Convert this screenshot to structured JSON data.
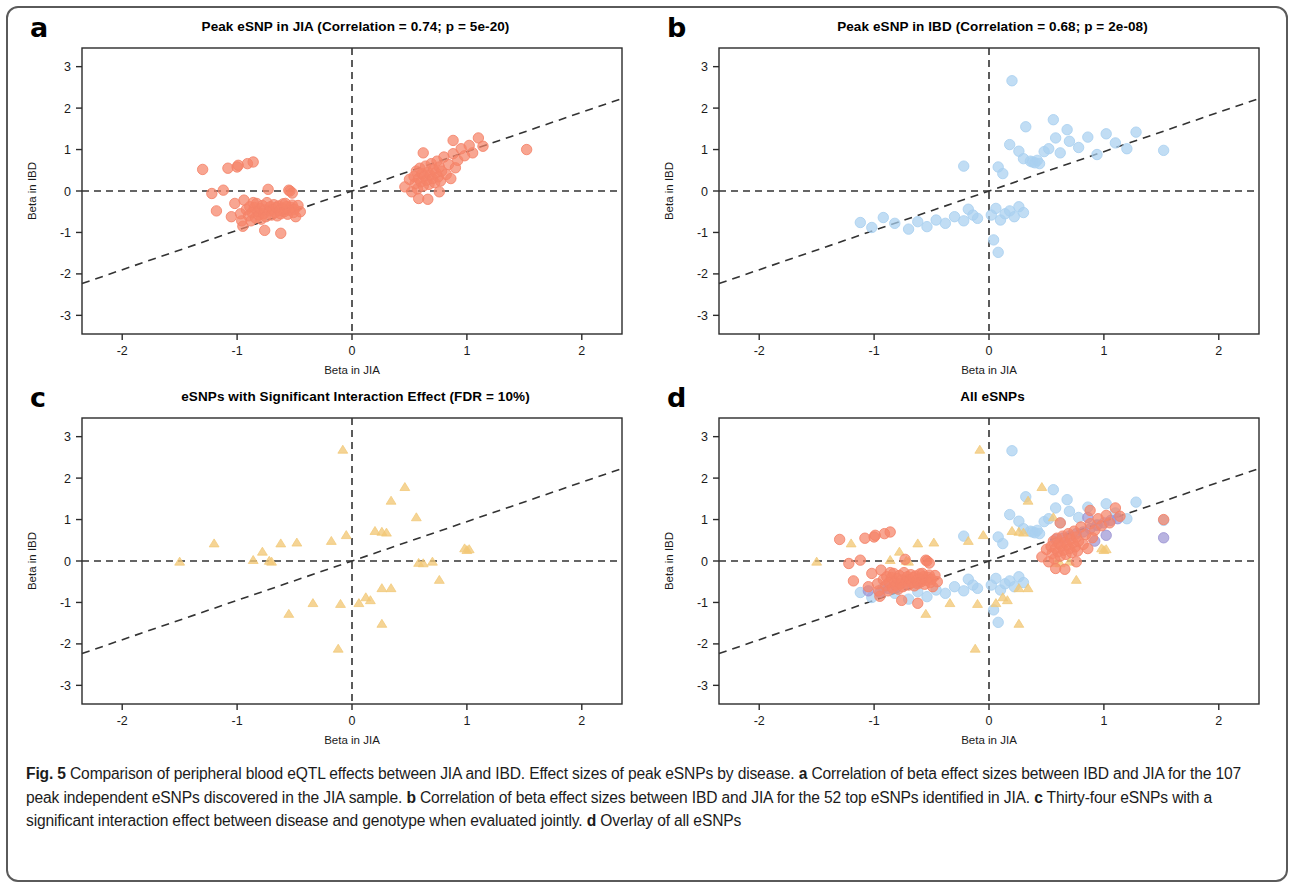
{
  "figure": {
    "label": "Fig. 5",
    "caption_text": " Comparison of peripheral blood eQTL effects between JIA and IBD. Effect sizes of peak eSNPs by disease. ",
    "caption_a_label": "a",
    "caption_a_text": " Correlation of beta effect sizes between IBD and JIA for the 107 peak independent eSNPs discovered in the JIA sample. ",
    "caption_b_label": "b",
    "caption_b_text": " Correlation of beta effect sizes between IBD and JIA for the 52 top eSNPs identified in JIA. ",
    "caption_c_label": "c",
    "caption_c_text": " Thirty-four eSNPs with a significant interaction effect between disease and genotype when evaluated jointly. ",
    "caption_d_label": "d",
    "caption_d_text": " Overlay of all eSNPs"
  },
  "colors": {
    "salmon": "#F58368",
    "blue": "#A9D0F0",
    "tan": "#F2C877",
    "purple": "#9D95D4",
    "axis": "#2b2b2b",
    "dash": "#333333"
  },
  "panels": [
    {
      "letter": "a",
      "title": "Peak eSNP in JIA (Correlation = 0.74; p = 5e-20)",
      "xlabel": "Beta in JIA",
      "ylabel": "Beta in IBD",
      "series_key": "a"
    },
    {
      "letter": "b",
      "title": "Peak eSNP in IBD (Correlation = 0.68; p = 2e-08)",
      "xlabel": "Beta in JIA",
      "ylabel": "Beta in IBD",
      "series_key": "b"
    },
    {
      "letter": "c",
      "title": "eSNPs with Significant Interaction Effect (FDR = 10%)",
      "xlabel": "Beta in JIA",
      "ylabel": "Beta in IBD",
      "series_key": "c"
    },
    {
      "letter": "d",
      "title": "All eSNPs",
      "xlabel": "Beta in JIA",
      "ylabel": "Beta in IBD",
      "series_key": "d"
    }
  ],
  "chart_data": [
    {
      "type": "scatter",
      "panel": "a",
      "title": "Peak eSNP in JIA (Correlation = 0.74; p = 5e-20)",
      "xlabel": "Beta in JIA",
      "ylabel": "Beta in IBD",
      "xlim": [
        -2.35,
        2.35
      ],
      "ylim": [
        -3.45,
        3.45
      ],
      "xticks": [
        -2,
        -1,
        0,
        1,
        2
      ],
      "yticks": [
        3,
        2,
        1,
        0,
        -1,
        -2,
        -3
      ],
      "xtick_labels": [
        "-2",
        "-1",
        "0",
        "1",
        "2"
      ],
      "ytick_labels": [
        "3",
        "2",
        "1",
        "0",
        "-1",
        "-2",
        "-3"
      ],
      "grid": false,
      "legend": "none",
      "correlation": 0.74,
      "pvalue": "5e-20",
      "n_points": 107,
      "marker": "circle",
      "color": "#F58368",
      "reference_lines": [
        {
          "kind": "horizontal",
          "y": 0,
          "style": "dashed"
        },
        {
          "kind": "vertical",
          "x": 0,
          "style": "dashed"
        },
        {
          "kind": "fit",
          "slope": 0.95,
          "intercept": 0.0,
          "style": "dashed"
        }
      ],
      "points": [
        [
          -1.3,
          0.52
        ],
        [
          -1.18,
          -0.48
        ],
        [
          -1.12,
          0.02
        ],
        [
          -1.08,
          0.55
        ],
        [
          -1.05,
          -0.62
        ],
        [
          -1.02,
          -0.3
        ],
        [
          -1.0,
          0.58
        ],
        [
          -0.99,
          0.62
        ],
        [
          -0.97,
          -0.55
        ],
        [
          -0.95,
          -0.85
        ],
        [
          -0.94,
          -0.22
        ],
        [
          -0.92,
          -0.45
        ],
        [
          -0.91,
          0.66
        ],
        [
          -0.9,
          -0.6
        ],
        [
          -0.89,
          -0.38
        ],
        [
          -0.88,
          -0.72
        ],
        [
          -0.87,
          -0.52
        ],
        [
          -0.86,
          0.7
        ],
        [
          -0.85,
          -0.4
        ],
        [
          -0.84,
          -0.65
        ],
        [
          -0.83,
          -0.3
        ],
        [
          -0.82,
          -0.5
        ],
        [
          -0.81,
          -0.58
        ],
        [
          -0.8,
          -0.42
        ],
        [
          -0.79,
          -0.68
        ],
        [
          -0.78,
          -0.35
        ],
        [
          -0.77,
          -0.55
        ],
        [
          -0.76,
          -0.46
        ],
        [
          -0.75,
          -0.62
        ],
        [
          -0.74,
          -0.28
        ],
        [
          -0.73,
          0.04
        ],
        [
          -0.72,
          -0.48
        ],
        [
          -0.71,
          -0.38
        ],
        [
          -0.7,
          -0.58
        ],
        [
          -0.69,
          -0.44
        ],
        [
          -0.68,
          -0.33
        ],
        [
          -0.67,
          -0.52
        ],
        [
          -0.66,
          -0.4
        ],
        [
          -0.65,
          -0.6
        ],
        [
          -0.64,
          -0.36
        ],
        [
          -0.63,
          -0.47
        ],
        [
          -0.62,
          -0.55
        ],
        [
          -0.61,
          -0.42
        ],
        [
          -0.6,
          -0.31
        ],
        [
          -0.59,
          -0.5
        ],
        [
          -0.58,
          -0.44
        ],
        [
          -0.57,
          -0.38
        ],
        [
          -0.56,
          -0.56
        ],
        [
          -0.55,
          -0.46
        ],
        [
          -0.54,
          0.0
        ],
        [
          -0.53,
          -0.4
        ],
        [
          -0.52,
          -0.34
        ],
        [
          -0.51,
          -0.52
        ],
        [
          -0.5,
          -0.44
        ],
        [
          -0.49,
          -0.62
        ],
        [
          -0.62,
          -1.02
        ],
        [
          -0.76,
          -0.95
        ],
        [
          -0.58,
          -0.3
        ],
        [
          -0.96,
          -0.72
        ],
        [
          -0.86,
          -0.28
        ],
        [
          -0.55,
          0.02
        ],
        [
          -0.52,
          -0.05
        ],
        [
          -0.47,
          -0.35
        ],
        [
          -0.45,
          -0.5
        ],
        [
          -1.22,
          -0.06
        ],
        [
          0.46,
          0.1
        ],
        [
          0.5,
          0.28
        ],
        [
          0.52,
          -0.02
        ],
        [
          0.54,
          0.35
        ],
        [
          0.55,
          0.18
        ],
        [
          0.56,
          0.48
        ],
        [
          0.57,
          0.05
        ],
        [
          0.58,
          0.3
        ],
        [
          0.59,
          0.55
        ],
        [
          0.6,
          0.22
        ],
        [
          0.61,
          0.42
        ],
        [
          0.62,
          0.12
        ],
        [
          0.63,
          0.36
        ],
        [
          0.64,
          0.6
        ],
        [
          0.65,
          0.26
        ],
        [
          0.66,
          0.45
        ],
        [
          0.67,
          0.16
        ],
        [
          0.68,
          0.38
        ],
        [
          0.69,
          0.66
        ],
        [
          0.7,
          0.3
        ],
        [
          0.71,
          0.52
        ],
        [
          0.72,
          0.2
        ],
        [
          0.73,
          0.44
        ],
        [
          0.74,
          0.72
        ],
        [
          0.75,
          0.34
        ],
        [
          0.76,
          0.58
        ],
        [
          0.77,
          0.24
        ],
        [
          0.78,
          0.48
        ],
        [
          0.8,
          0.82
        ],
        [
          0.82,
          0.4
        ],
        [
          0.84,
          0.64
        ],
        [
          0.86,
          0.3
        ],
        [
          0.88,
          0.9
        ],
        [
          0.9,
          0.56
        ],
        [
          0.92,
          0.74
        ],
        [
          0.95,
          1.02
        ],
        [
          0.98,
          0.85
        ],
        [
          1.02,
          1.1
        ],
        [
          1.05,
          0.92
        ],
        [
          1.1,
          1.28
        ],
        [
          1.14,
          1.08
        ],
        [
          1.52,
          1.0
        ],
        [
          0.66,
          -0.2
        ],
        [
          0.58,
          -0.18
        ],
        [
          0.76,
          -0.02
        ],
        [
          0.62,
          0.92
        ],
        [
          0.88,
          1.22
        ]
      ]
    },
    {
      "type": "scatter",
      "panel": "b",
      "title": "Peak eSNP in IBD (Correlation = 0.68; p = 2e-08)",
      "xlabel": "Beta in JIA",
      "ylabel": "Beta in IBD",
      "xlim": [
        -2.35,
        2.35
      ],
      "ylim": [
        -3.45,
        3.45
      ],
      "xticks": [
        -2,
        -1,
        0,
        1,
        2
      ],
      "yticks": [
        3,
        2,
        1,
        0,
        -1,
        -2,
        -3
      ],
      "xtick_labels": [
        "-2",
        "-1",
        "0",
        "1",
        "2"
      ],
      "ytick_labels": [
        "3",
        "2",
        "1",
        "0",
        "-1",
        "-2",
        "-3"
      ],
      "grid": false,
      "legend": "none",
      "correlation": 0.68,
      "pvalue": "2e-08",
      "n_points": 52,
      "marker": "circle",
      "color": "#A9D0F0",
      "reference_lines": [
        {
          "kind": "horizontal",
          "y": 0,
          "style": "dashed"
        },
        {
          "kind": "vertical",
          "x": 0,
          "style": "dashed"
        },
        {
          "kind": "fit",
          "slope": 0.95,
          "intercept": 0.0,
          "style": "dashed"
        }
      ],
      "points": [
        [
          0.2,
          2.66
        ],
        [
          0.56,
          1.72
        ],
        [
          0.32,
          1.55
        ],
        [
          0.68,
          1.48
        ],
        [
          0.18,
          1.12
        ],
        [
          0.26,
          0.96
        ],
        [
          0.3,
          0.78
        ],
        [
          0.36,
          0.72
        ],
        [
          0.38,
          0.7
        ],
        [
          0.4,
          0.68
        ],
        [
          0.42,
          0.74
        ],
        [
          0.44,
          0.66
        ],
        [
          0.48,
          0.95
        ],
        [
          0.52,
          1.02
        ],
        [
          0.58,
          1.28
        ],
        [
          0.62,
          0.92
        ],
        [
          0.7,
          1.2
        ],
        [
          0.78,
          1.05
        ],
        [
          0.86,
          1.3
        ],
        [
          0.94,
          0.88
        ],
        [
          1.02,
          1.38
        ],
        [
          1.1,
          1.16
        ],
        [
          1.2,
          1.02
        ],
        [
          1.28,
          1.42
        ],
        [
          1.52,
          0.98
        ],
        [
          0.08,
          0.58
        ],
        [
          0.12,
          0.42
        ],
        [
          -0.22,
          0.6
        ],
        [
          0.02,
          -0.58
        ],
        [
          0.06,
          -0.42
        ],
        [
          0.1,
          -0.7
        ],
        [
          0.14,
          -0.55
        ],
        [
          0.18,
          -0.48
        ],
        [
          0.22,
          -0.62
        ],
        [
          0.26,
          -0.38
        ],
        [
          0.3,
          -0.52
        ],
        [
          -0.1,
          -0.66
        ],
        [
          -0.14,
          -0.58
        ],
        [
          -0.18,
          -0.44
        ],
        [
          -0.22,
          -0.72
        ],
        [
          -0.3,
          -0.62
        ],
        [
          -0.38,
          -0.78
        ],
        [
          -0.46,
          -0.7
        ],
        [
          -0.54,
          -0.86
        ],
        [
          -0.62,
          -0.74
        ],
        [
          -0.7,
          -0.92
        ],
        [
          -0.82,
          -0.78
        ],
        [
          -0.92,
          -0.64
        ],
        [
          -1.02,
          -0.88
        ],
        [
          -1.12,
          -0.76
        ],
        [
          0.04,
          -1.18
        ],
        [
          0.08,
          -1.48
        ]
      ]
    },
    {
      "type": "scatter",
      "panel": "c",
      "title": "eSNPs with Significant Interaction Effect (FDR = 10%)",
      "xlabel": "Beta in JIA",
      "ylabel": "Beta in IBD",
      "xlim": [
        -2.35,
        2.35
      ],
      "ylim": [
        -3.45,
        3.45
      ],
      "xticks": [
        -2,
        -1,
        0,
        1,
        2
      ],
      "yticks": [
        3,
        2,
        1,
        0,
        -1,
        -2,
        -3
      ],
      "xtick_labels": [
        "-2",
        "-1",
        "0",
        "1",
        "2"
      ],
      "ytick_labels": [
        "3",
        "2",
        "1",
        "0",
        "-1",
        "-2",
        "-3"
      ],
      "grid": false,
      "legend": "none",
      "fdr": "10%",
      "n_points": 34,
      "marker": "triangle",
      "color": "#F2C877",
      "reference_lines": [
        {
          "kind": "horizontal",
          "y": 0,
          "style": "dashed"
        },
        {
          "kind": "vertical",
          "x": 0,
          "style": "dashed"
        },
        {
          "kind": "fit",
          "slope": 0.95,
          "intercept": 0.0,
          "style": "dashed"
        }
      ],
      "points": [
        [
          -0.08,
          2.68
        ],
        [
          0.46,
          1.78
        ],
        [
          0.34,
          1.45
        ],
        [
          0.56,
          1.05
        ],
        [
          0.2,
          0.72
        ],
        [
          0.26,
          0.7
        ],
        [
          0.3,
          0.68
        ],
        [
          -0.05,
          0.62
        ],
        [
          -0.18,
          0.48
        ],
        [
          -0.48,
          0.44
        ],
        [
          -1.2,
          0.42
        ],
        [
          -0.62,
          0.42
        ],
        [
          -0.78,
          0.22
        ],
        [
          -0.86,
          0.02
        ],
        [
          -0.72,
          0.0
        ],
        [
          -0.7,
          -0.02
        ],
        [
          -1.5,
          -0.02
        ],
        [
          0.58,
          -0.05
        ],
        [
          0.62,
          -0.06
        ],
        [
          0.7,
          -0.02
        ],
        [
          0.98,
          0.3
        ],
        [
          1.02,
          0.28
        ],
        [
          1.0,
          0.26
        ],
        [
          0.76,
          -0.46
        ],
        [
          0.26,
          -0.66
        ],
        [
          0.34,
          -0.66
        ],
        [
          0.12,
          -0.88
        ],
        [
          0.06,
          -1.02
        ],
        [
          -0.1,
          -1.04
        ],
        [
          -0.34,
          -1.02
        ],
        [
          -0.55,
          -1.28
        ],
        [
          0.26,
          -1.52
        ],
        [
          -0.12,
          -2.12
        ],
        [
          0.16,
          -0.95
        ]
      ]
    },
    {
      "type": "scatter",
      "panel": "d",
      "title": "All eSNPs",
      "xlabel": "Beta in JIA",
      "ylabel": "Beta in IBD",
      "xlim": [
        -2.35,
        2.35
      ],
      "ylim": [
        -3.45,
        3.45
      ],
      "xticks": [
        -2,
        -1,
        0,
        1,
        2
      ],
      "yticks": [
        3,
        2,
        1,
        0,
        -1,
        -2,
        -3
      ],
      "xtick_labels": [
        "-2",
        "-1",
        "0",
        "1",
        "2"
      ],
      "ytick_labels": [
        "3",
        "2",
        "1",
        "0",
        "-1",
        "-2",
        "-3"
      ],
      "grid": false,
      "legend": "none",
      "overlay_of": [
        "a",
        "b",
        "c"
      ],
      "marker": "mixed",
      "extra_color": "#9D95D4",
      "reference_lines": [
        {
          "kind": "horizontal",
          "y": 0,
          "style": "dashed"
        },
        {
          "kind": "vertical",
          "x": 0,
          "style": "dashed"
        },
        {
          "kind": "fit",
          "slope": 0.95,
          "intercept": 0.0,
          "style": "dashed"
        }
      ],
      "purple_points": [
        [
          -1.05,
          -0.72
        ],
        [
          -0.95,
          -0.76
        ],
        [
          -0.88,
          -0.66
        ],
        [
          -0.8,
          -0.62
        ],
        [
          -0.72,
          -0.55
        ],
        [
          -0.62,
          -0.52
        ],
        [
          0.58,
          0.52
        ],
        [
          0.64,
          0.55
        ],
        [
          0.7,
          0.6
        ],
        [
          0.76,
          0.66
        ],
        [
          0.82,
          0.7
        ],
        [
          0.88,
          0.78
        ],
        [
          0.94,
          0.86
        ],
        [
          1.0,
          0.92
        ],
        [
          1.06,
          0.98
        ],
        [
          1.12,
          1.02
        ],
        [
          0.86,
          1.05
        ],
        [
          1.52,
          0.56
        ],
        [
          1.02,
          0.62
        ],
        [
          0.92,
          0.48
        ]
      ]
    }
  ]
}
